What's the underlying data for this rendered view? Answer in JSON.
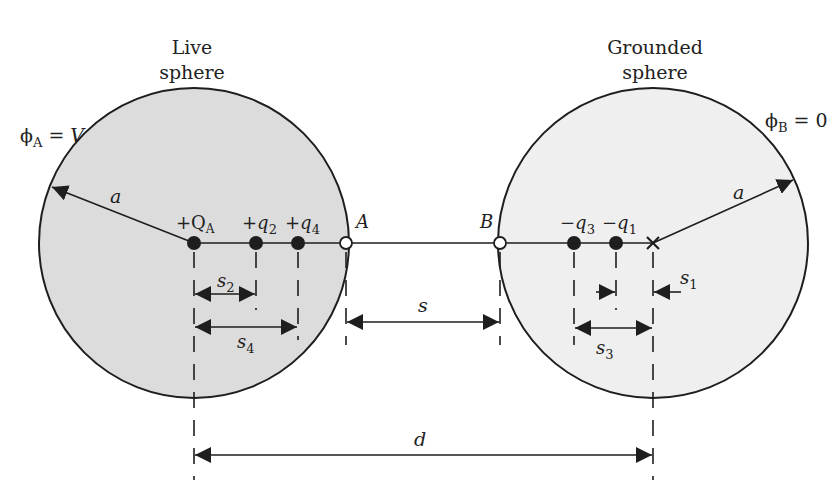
{
  "diagram": {
    "colors": {
      "live_fill": "#dcdcdc",
      "grounded_fill": "#efefef",
      "stroke": "#1e1e1e",
      "background": "#ffffff"
    },
    "live_sphere": {
      "title_line1": "Live",
      "title_line2": "sphere",
      "potential_symbol": "ϕ",
      "potential_sub": "A",
      "potential_eq": " = ",
      "potential_val": "V",
      "radius_label": "a",
      "charges": [
        {
          "sign": "+",
          "sym": "Q",
          "sub": "A"
        },
        {
          "sign": "+",
          "sym": "q",
          "sub": "2"
        },
        {
          "sign": "+",
          "sym": "q",
          "sub": "4"
        }
      ],
      "point_label": "A"
    },
    "grounded_sphere": {
      "title_line1": "Grounded",
      "title_line2": "sphere",
      "potential_symbol": "ϕ",
      "potential_sub": "B",
      "potential_eq": " = ",
      "potential_val": "0",
      "radius_label": "a",
      "charges": [
        {
          "sign": "−",
          "sym": "q",
          "sub": "3"
        },
        {
          "sign": "−",
          "sym": "q",
          "sub": "1"
        }
      ],
      "point_label": "B"
    },
    "dimensions": {
      "s2": {
        "sym": "s",
        "sub": "2"
      },
      "s4": {
        "sym": "s",
        "sub": "4"
      },
      "s": {
        "sym": "s"
      },
      "s1": {
        "sym": "s",
        "sub": "1"
      },
      "s3": {
        "sym": "s",
        "sub": "3"
      },
      "d": {
        "sym": "d"
      }
    }
  }
}
